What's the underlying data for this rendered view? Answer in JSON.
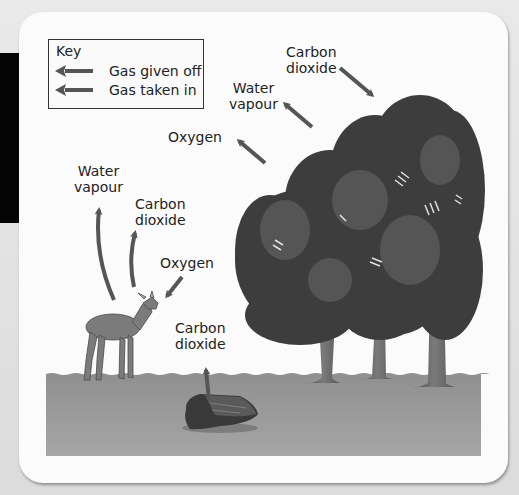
{
  "diagram": {
    "key": {
      "title": "Key",
      "items": [
        {
          "label": "Gas given off",
          "arrow": "left-arrow",
          "color": "#555555"
        },
        {
          "label": "Gas taken in",
          "arrow": "left-arrow",
          "color": "#555555"
        }
      ]
    },
    "labels": {
      "trees_co2": [
        "Carbon",
        "dioxide"
      ],
      "trees_water": [
        "Water",
        "vapour"
      ],
      "trees_oxygen": "Oxygen",
      "deer_water": [
        "Water",
        "vapour"
      ],
      "deer_co2": [
        "Carbon",
        "dioxide"
      ],
      "deer_oxygen": "Oxygen",
      "log_co2": [
        "Carbon",
        "dioxide"
      ]
    },
    "elements": [
      "trees",
      "deer",
      "rotting-log",
      "ground"
    ],
    "colors": {
      "arrow": "#555555",
      "ground": "#9a9a9a",
      "foliage": "#3c3c3c",
      "trunk": "#6a6a6a",
      "deer": "#7a7a7a",
      "card": "#fbfbfb"
    }
  }
}
